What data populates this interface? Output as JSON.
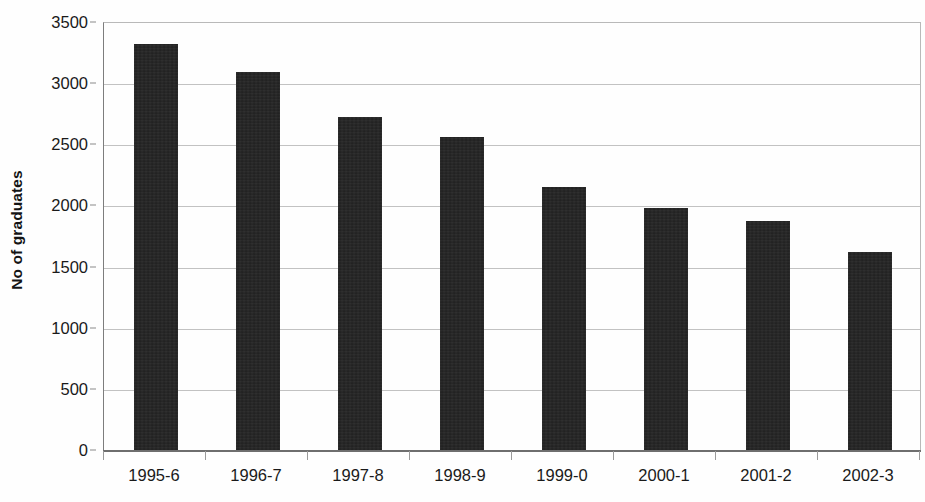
{
  "chart_data": {
    "type": "bar",
    "title": "",
    "subtitle": "",
    "xlabel": "",
    "ylabel": "No of graduates",
    "categories": [
      "1995-6",
      "1996-7",
      "1997-8",
      "1998-9",
      "1999-0",
      "2000-1",
      "2001-2",
      "2002-3"
    ],
    "values": [
      3330,
      3100,
      2730,
      2570,
      2160,
      1990,
      1880,
      1630
    ],
    "series": [
      {
        "name": "No of graduates",
        "values": [
          3330,
          3100,
          2730,
          2570,
          2160,
          1990,
          1880,
          1630
        ]
      }
    ],
    "ylim": [
      0,
      3500
    ],
    "ytick_values": [
      0,
      500,
      1000,
      1500,
      2000,
      2500,
      3000,
      3500
    ],
    "ytick_labels": [
      "0",
      "500",
      "1000",
      "1500",
      "2000",
      "2500",
      "3000",
      "3500"
    ],
    "grid": true,
    "grid_axis": "y",
    "legend": false,
    "legend_position": "none",
    "bar_color": "#212121",
    "gridline_color": "#c2c2c2",
    "axis_color": "#6e6e6e",
    "background_color": "#ffffff"
  }
}
